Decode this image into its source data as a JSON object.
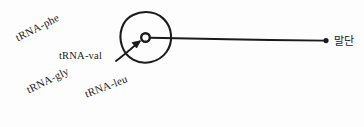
{
  "figure": {
    "background_color": "#fdfdfd",
    "ink_color": "#1b1b1b",
    "style": "hand-drawn biology sketch"
  },
  "labels": {
    "trna_phe": "tRNA-phe",
    "trna_val": "tRNA-val",
    "trna_gly": "tRNA-gly",
    "trna_leu": "tRNA-leu",
    "terminus": "말단"
  },
  "shapes": {
    "ribosome_circle": "large hand-drawn circle",
    "inner_circle": "small ring inside ribosome",
    "strand_line": "long horizontal line to terminus",
    "terminus_dot": "filled dot at right end",
    "val_arrow": "arrow from tRNA-val label to inner ring"
  }
}
